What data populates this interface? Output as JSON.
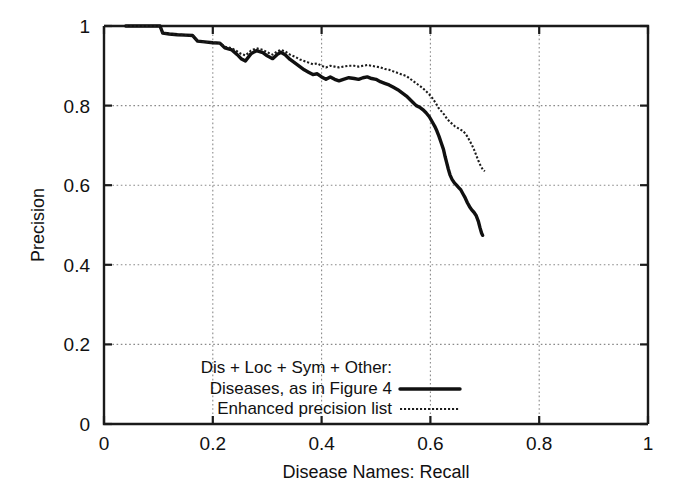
{
  "chart_data": {
    "type": "line",
    "title": "",
    "xlabel": "Disease Names:  Recall",
    "ylabel": "Precision",
    "xlim": [
      0,
      1
    ],
    "ylim": [
      0,
      1
    ],
    "xticks": [
      "0",
      "0.2",
      "0.4",
      "0.6",
      "0.8",
      "1"
    ],
    "xtick_values": [
      0,
      0.2,
      0.4,
      0.6,
      0.8,
      1
    ],
    "yticks": [
      "0",
      "0.2",
      "0.4",
      "0.6",
      "0.8",
      "1"
    ],
    "ytick_values": [
      0,
      0.2,
      0.4,
      0.6,
      0.8,
      1
    ],
    "grid": true,
    "legend_position": "bottom-center",
    "legend_header": "Dis + Loc + Sym + Other:",
    "series": [
      {
        "name": "Diseases, as in Figure 4",
        "style": "solid",
        "points": [
          [
            0.04,
            1.0
          ],
          [
            0.06,
            1.0
          ],
          [
            0.08,
            1.0
          ],
          [
            0.095,
            1.0
          ],
          [
            0.103,
            1.0
          ],
          [
            0.108,
            0.982
          ],
          [
            0.12,
            0.98
          ],
          [
            0.135,
            0.978
          ],
          [
            0.15,
            0.977
          ],
          [
            0.163,
            0.976
          ],
          [
            0.172,
            0.962
          ],
          [
            0.185,
            0.96
          ],
          [
            0.2,
            0.958
          ],
          [
            0.213,
            0.957
          ],
          [
            0.222,
            0.945
          ],
          [
            0.235,
            0.94
          ],
          [
            0.245,
            0.928
          ],
          [
            0.252,
            0.918
          ],
          [
            0.26,
            0.912
          ],
          [
            0.27,
            0.93
          ],
          [
            0.28,
            0.938
          ],
          [
            0.292,
            0.933
          ],
          [
            0.3,
            0.925
          ],
          [
            0.31,
            0.918
          ],
          [
            0.318,
            0.928
          ],
          [
            0.325,
            0.934
          ],
          [
            0.333,
            0.928
          ],
          [
            0.342,
            0.916
          ],
          [
            0.352,
            0.906
          ],
          [
            0.36,
            0.898
          ],
          [
            0.368,
            0.89
          ],
          [
            0.376,
            0.884
          ],
          [
            0.384,
            0.878
          ],
          [
            0.392,
            0.88
          ],
          [
            0.4,
            0.872
          ],
          [
            0.408,
            0.866
          ],
          [
            0.416,
            0.872
          ],
          [
            0.424,
            0.866
          ],
          [
            0.432,
            0.862
          ],
          [
            0.44,
            0.866
          ],
          [
            0.45,
            0.87
          ],
          [
            0.46,
            0.868
          ],
          [
            0.468,
            0.866
          ],
          [
            0.476,
            0.87
          ],
          [
            0.484,
            0.872
          ],
          [
            0.492,
            0.868
          ],
          [
            0.5,
            0.866
          ],
          [
            0.508,
            0.86
          ],
          [
            0.516,
            0.856
          ],
          [
            0.524,
            0.852
          ],
          [
            0.532,
            0.846
          ],
          [
            0.54,
            0.84
          ],
          [
            0.548,
            0.832
          ],
          [
            0.556,
            0.824
          ],
          [
            0.562,
            0.816
          ],
          [
            0.568,
            0.808
          ],
          [
            0.574,
            0.8
          ],
          [
            0.58,
            0.796
          ],
          [
            0.586,
            0.79
          ],
          [
            0.592,
            0.782
          ],
          [
            0.598,
            0.772
          ],
          [
            0.603,
            0.76
          ],
          [
            0.608,
            0.748
          ],
          [
            0.612,
            0.736
          ],
          [
            0.616,
            0.722
          ],
          [
            0.62,
            0.706
          ],
          [
            0.624,
            0.69
          ],
          [
            0.627,
            0.672
          ],
          [
            0.63,
            0.656
          ],
          [
            0.633,
            0.64
          ],
          [
            0.636,
            0.626
          ],
          [
            0.64,
            0.614
          ],
          [
            0.644,
            0.606
          ],
          [
            0.648,
            0.6
          ],
          [
            0.652,
            0.594
          ],
          [
            0.656,
            0.588
          ],
          [
            0.66,
            0.578
          ],
          [
            0.664,
            0.568
          ],
          [
            0.668,
            0.556
          ],
          [
            0.672,
            0.546
          ],
          [
            0.676,
            0.538
          ],
          [
            0.68,
            0.532
          ],
          [
            0.684,
            0.524
          ],
          [
            0.688,
            0.51
          ],
          [
            0.691,
            0.494
          ],
          [
            0.694,
            0.48
          ],
          [
            0.696,
            0.474
          ]
        ]
      },
      {
        "name": "Enhanced precision list",
        "style": "dotted",
        "points": [
          [
            0.04,
            1.0
          ],
          [
            0.06,
            1.0
          ],
          [
            0.08,
            1.0
          ],
          [
            0.095,
            1.0
          ],
          [
            0.103,
            1.0
          ],
          [
            0.108,
            0.982
          ],
          [
            0.12,
            0.98
          ],
          [
            0.135,
            0.978
          ],
          [
            0.15,
            0.977
          ],
          [
            0.163,
            0.976
          ],
          [
            0.172,
            0.962
          ],
          [
            0.185,
            0.96
          ],
          [
            0.2,
            0.958
          ],
          [
            0.213,
            0.957
          ],
          [
            0.222,
            0.948
          ],
          [
            0.235,
            0.944
          ],
          [
            0.245,
            0.936
          ],
          [
            0.252,
            0.93
          ],
          [
            0.26,
            0.926
          ],
          [
            0.27,
            0.938
          ],
          [
            0.28,
            0.944
          ],
          [
            0.292,
            0.94
          ],
          [
            0.3,
            0.934
          ],
          [
            0.31,
            0.928
          ],
          [
            0.318,
            0.936
          ],
          [
            0.325,
            0.94
          ],
          [
            0.333,
            0.936
          ],
          [
            0.342,
            0.928
          ],
          [
            0.352,
            0.922
          ],
          [
            0.36,
            0.916
          ],
          [
            0.368,
            0.912
          ],
          [
            0.376,
            0.908
          ],
          [
            0.384,
            0.904
          ],
          [
            0.392,
            0.906
          ],
          [
            0.4,
            0.9
          ],
          [
            0.408,
            0.896
          ],
          [
            0.416,
            0.9
          ],
          [
            0.424,
            0.898
          ],
          [
            0.432,
            0.896
          ],
          [
            0.44,
            0.898
          ],
          [
            0.45,
            0.9
          ],
          [
            0.46,
            0.9
          ],
          [
            0.468,
            0.898
          ],
          [
            0.476,
            0.9
          ],
          [
            0.484,
            0.902
          ],
          [
            0.492,
            0.9
          ],
          [
            0.5,
            0.898
          ],
          [
            0.508,
            0.896
          ],
          [
            0.516,
            0.892
          ],
          [
            0.524,
            0.89
          ],
          [
            0.532,
            0.886
          ],
          [
            0.54,
            0.882
          ],
          [
            0.548,
            0.878
          ],
          [
            0.556,
            0.874
          ],
          [
            0.562,
            0.868
          ],
          [
            0.568,
            0.862
          ],
          [
            0.574,
            0.856
          ],
          [
            0.58,
            0.85
          ],
          [
            0.586,
            0.844
          ],
          [
            0.592,
            0.836
          ],
          [
            0.598,
            0.828
          ],
          [
            0.604,
            0.818
          ],
          [
            0.61,
            0.806
          ],
          [
            0.615,
            0.794
          ],
          [
            0.62,
            0.786
          ],
          [
            0.625,
            0.778
          ],
          [
            0.63,
            0.768
          ],
          [
            0.635,
            0.76
          ],
          [
            0.64,
            0.754
          ],
          [
            0.645,
            0.748
          ],
          [
            0.65,
            0.744
          ],
          [
            0.655,
            0.74
          ],
          [
            0.66,
            0.736
          ],
          [
            0.664,
            0.73
          ],
          [
            0.668,
            0.722
          ],
          [
            0.672,
            0.712
          ],
          [
            0.676,
            0.702
          ],
          [
            0.68,
            0.69
          ],
          [
            0.684,
            0.676
          ],
          [
            0.688,
            0.662
          ],
          [
            0.692,
            0.65
          ],
          [
            0.696,
            0.64
          ],
          [
            0.7,
            0.635
          ]
        ]
      }
    ]
  },
  "legend": {
    "header": "Dis + Loc + Sym + Other:",
    "entries": [
      {
        "label": "Diseases, as in Figure 4",
        "style": "solid"
      },
      {
        "label": "Enhanced precision list",
        "style": "dotted"
      }
    ]
  },
  "axes": {
    "x_title": "Disease Names:  Recall",
    "y_title": "Precision",
    "x_tick_labels": [
      "0",
      "0.2",
      "0.4",
      "0.6",
      "0.8",
      "1"
    ],
    "y_tick_labels": [
      "0",
      "0.2",
      "0.4",
      "0.6",
      "0.8",
      "1"
    ]
  },
  "colors": {
    "background": "#ffffff",
    "foreground": "#111111",
    "grid": "#8a8a8a",
    "series_solid": "#101010",
    "series_dotted": "#1c1c1c"
  }
}
